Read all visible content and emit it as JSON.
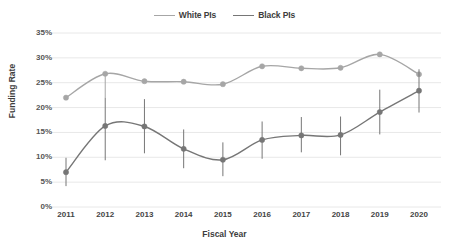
{
  "chart_data": {
    "type": "line",
    "title": "",
    "xlabel": "Fiscal Year",
    "ylabel": "Funding Rate",
    "categories": [
      "2011",
      "2012",
      "2013",
      "2014",
      "2015",
      "2016",
      "2017",
      "2018",
      "2019",
      "2020"
    ],
    "x": [
      2011,
      2012,
      2013,
      2014,
      2015,
      2016,
      2017,
      2018,
      2019,
      2020
    ],
    "ylim": [
      0,
      35
    ],
    "yticks": [
      "0%",
      "5%",
      "10%",
      "15%",
      "20%",
      "25%",
      "30%",
      "35%"
    ],
    "ytick_values": [
      0,
      5,
      10,
      15,
      20,
      25,
      30,
      35
    ],
    "grid": "horizontal",
    "legend_position": "top-center",
    "series": [
      {
        "name": "White PIs",
        "color": "#a6a6a6",
        "values": [
          22.0,
          26.8,
          25.3,
          25.2,
          24.7,
          28.3,
          27.9,
          28.0,
          30.7,
          26.7
        ],
        "error_low": [
          21.7,
          22.0,
          25.0,
          25.0,
          24.4,
          28.0,
          27.6,
          27.7,
          30.3,
          26.4
        ],
        "error_high": [
          22.3,
          27.2,
          25.6,
          25.5,
          25.0,
          28.6,
          28.2,
          28.3,
          31.1,
          27.0
        ]
      },
      {
        "name": "Black PIs",
        "color": "#767676",
        "values": [
          7.0,
          16.3,
          16.2,
          11.7,
          9.5,
          13.5,
          14.4,
          14.5,
          19.1,
          23.4
        ],
        "error_low": [
          4.2,
          9.4,
          10.8,
          7.8,
          6.2,
          9.7,
          11.0,
          10.4,
          14.6,
          19.0
        ],
        "error_high": [
          9.9,
          22.0,
          21.7,
          15.6,
          13.0,
          17.2,
          18.1,
          18.2,
          23.6,
          27.7
        ]
      }
    ]
  },
  "legend": {
    "entries": [
      {
        "label": "White PIs"
      },
      {
        "label": "Black PIs"
      }
    ]
  },
  "axes": {
    "y_title": "Funding Rate",
    "x_title": "Fiscal Year"
  },
  "colors": {
    "white_pis": "#a6a6a6",
    "black_pis": "#767676",
    "grid": "#e8e8e8",
    "text": "#3d3d3d"
  }
}
